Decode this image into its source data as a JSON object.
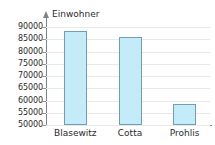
{
  "chart_data": {
    "type": "bar",
    "title": "",
    "axis_title": "Einwohner",
    "xlabel": "",
    "ylabel": "Einwohner",
    "categories": [
      "Blasewitz",
      "Cotta",
      "Prohlis"
    ],
    "values": [
      88200,
      85800,
      58500
    ],
    "ylim": [
      50000,
      90000
    ],
    "yticks": [
      50000,
      55000,
      60000,
      65000,
      70000,
      75000,
      80000,
      85000,
      90000
    ],
    "ytick_labels": [
      "50000",
      "55000",
      "60000",
      "65000",
      "70000",
      "75000",
      "80000",
      "85000",
      "90000"
    ],
    "grid": true,
    "legend": false,
    "bar_fill_color": "#c3ecf8",
    "bar_border_color": "#6f9fb4",
    "gridline_color": "#e9e9e9",
    "axis_color": "#7d8386",
    "text_color": "#2b2b2b",
    "background_color": "#ffffff",
    "y_axis_arrow_icon": "up-arrow-icon"
  }
}
